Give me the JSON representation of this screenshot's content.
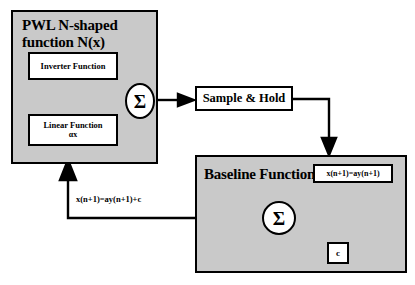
{
  "diagram": {
    "background_color": "#ffffff",
    "block_fill_color": "#c9c9c9",
    "box_fill_color": "#ffffff",
    "line_color": "#000000"
  },
  "blocks": {
    "pwl": {
      "title": "PWL N-shaped\nfunction N(x)",
      "inner_boxes": {
        "inverter": {
          "label": "Inverter Function"
        },
        "linear": {
          "label": "Linear Function",
          "sublabel": "αx"
        }
      },
      "summation": {
        "symbol": "Σ"
      }
    },
    "sample_hold": {
      "label": "Sample & Hold"
    },
    "baseline": {
      "title": "Baseline Function",
      "summation": {
        "symbol": "Σ"
      },
      "inner_boxes": {
        "equation": {
          "label": "x(n+1)=ay(n+1)"
        },
        "constant": {
          "label": "c"
        }
      }
    }
  },
  "wires": {
    "feedback_label": "x(n+1)=ay(n+1)+c"
  }
}
